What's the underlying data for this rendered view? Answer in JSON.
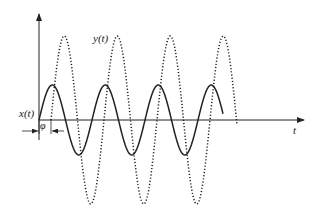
{
  "diagram": {
    "labels": {
      "x_signal": "x(t)",
      "y_signal": "y(t)",
      "time_axis": "t",
      "phase": "φ"
    },
    "colors": {
      "stroke": "#222222",
      "background": "#ffffff"
    },
    "series": [
      {
        "name": "x(t)",
        "style": "solid",
        "amplitude_px": 35,
        "period_px": 53,
        "start_x": 39,
        "end_x": 223
      },
      {
        "name": "y(t)",
        "style": "dotted",
        "amplitude_px": 84,
        "period_px": 53,
        "start_x": 51,
        "end_x": 237
      }
    ]
  }
}
